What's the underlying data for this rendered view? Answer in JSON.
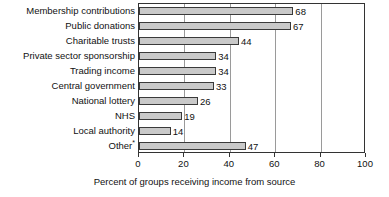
{
  "chart_data": {
    "type": "bar",
    "orientation": "horizontal",
    "title": "",
    "xlabel": "Percent of groups receiving income from source",
    "ylabel": "",
    "xlim": [
      0,
      100
    ],
    "xticks": [
      0,
      20,
      40,
      60,
      80,
      100
    ],
    "xtick_labels": [
      "0",
      "20",
      "40",
      "60",
      "80",
      "100"
    ],
    "grid": "vertical",
    "legend": "none",
    "categories": [
      "Membership contributions",
      "Public donations",
      "Charitable trusts",
      "Private sector sponsorship",
      "Trading income",
      "Central government",
      "National lottery",
      "NHS",
      "Local authority",
      "Other"
    ],
    "category_footnote_markers": [
      "",
      "",
      "",
      "",
      "",
      "",
      "",
      "",
      "",
      "*"
    ],
    "values": [
      68,
      67,
      44,
      34,
      34,
      33,
      26,
      19,
      14,
      47
    ],
    "value_labels": [
      "68",
      "67",
      "44",
      "34",
      "34",
      "33",
      "26",
      "19",
      "14",
      "47"
    ],
    "bar_fill_color": "#c9c9c9",
    "bar_border_color": "#3a3a3a",
    "gridline_color": "#9a9a9a",
    "axis_color": "#333333"
  }
}
